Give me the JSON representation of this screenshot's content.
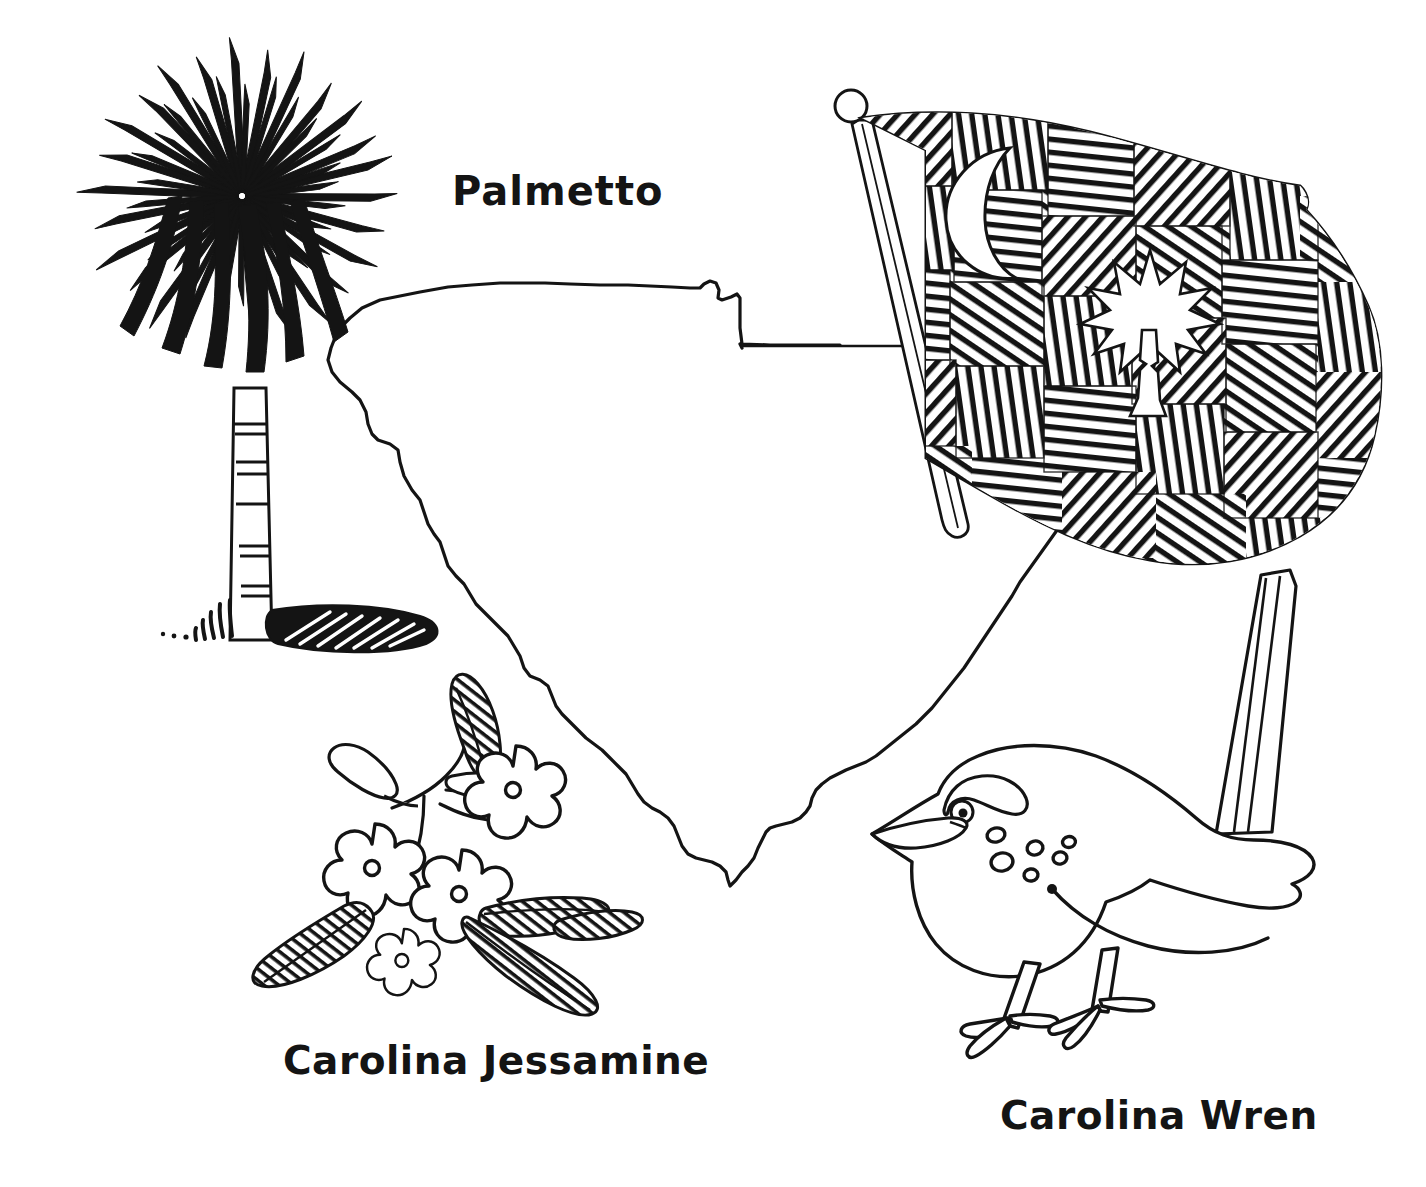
{
  "page": {
    "background_color": "#ffffff",
    "ink_color": "#141414",
    "style": "black-and-white line-art coloring page"
  },
  "labels": {
    "palmetto": "Palmetto",
    "jessamine": "Carolina Jessamine",
    "wren": "Carolina Wren"
  },
  "illustrations": {
    "map": {
      "name": "South Carolina state outline map",
      "stroke": "#141414",
      "fill": "none"
    },
    "palmetto_tree": {
      "name": "Palmetto tree",
      "parts": [
        "frond-crown",
        "segmented-trunk",
        "ground-shadow",
        "grass-tufts"
      ]
    },
    "state_flag": {
      "name": "South Carolina state flag",
      "parts": [
        "flagpole",
        "finial-ball",
        "hatched-field",
        "crescent-moon",
        "palmetto-silhouette"
      ]
    },
    "jessamine": {
      "name": "Carolina Jessamine flowering sprig",
      "flower_count": 5,
      "petals_per_flower": 5,
      "parts": [
        "flowers",
        "bud",
        "hatched-leaves",
        "stems"
      ]
    },
    "wren": {
      "name": "Carolina Wren bird",
      "parts": [
        "upright-striped-tail",
        "eyebrow-stripe",
        "eye",
        "beak",
        "breast-spots",
        "wing",
        "two-legs-with-toes"
      ]
    }
  },
  "leader_lines": [
    {
      "from": "map-northeast-corner",
      "to": "flag"
    }
  ]
}
